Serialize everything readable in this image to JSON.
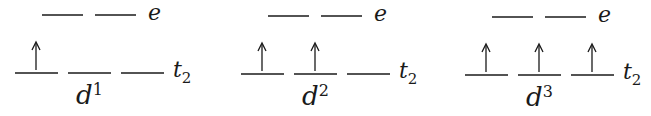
{
  "diagram": {
    "type": "crystal-field-splitting",
    "panels": [
      {
        "config": "d",
        "superscript": "1",
        "upper_label": "e",
        "lower_label": "t",
        "lower_subscript": "2",
        "upper_orbitals": 2,
        "lower_orbitals": 3,
        "electrons_in_lower": [
          true,
          false,
          false
        ],
        "offset_x": 0
      },
      {
        "config": "d",
        "superscript": "2",
        "upper_label": "e",
        "lower_label": "t",
        "lower_subscript": "2",
        "upper_orbitals": 2,
        "lower_orbitals": 3,
        "electrons_in_lower": [
          true,
          true,
          false
        ],
        "offset_x": 226
      },
      {
        "config": "d",
        "superscript": "3",
        "upper_label": "e",
        "lower_label": "t",
        "lower_subscript": "2",
        "upper_orbitals": 2,
        "lower_orbitals": 3,
        "electrons_in_lower": [
          true,
          true,
          true
        ],
        "offset_x": 450
      }
    ],
    "colors": {
      "line": "#1a1a1a",
      "background": "#ffffff"
    }
  }
}
